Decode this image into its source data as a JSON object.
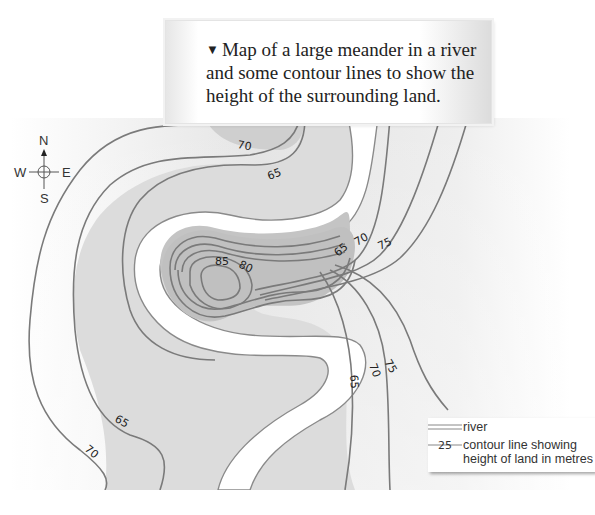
{
  "caption": {
    "bullet": "▼",
    "text": "Map of a large meander in a river and some contour lines to show the height of the surrounding land."
  },
  "compass": {
    "north": "N",
    "south": "S",
    "east": "E",
    "west": "W"
  },
  "contour_labels": [
    {
      "value": "70",
      "position": "top-center"
    },
    {
      "value": "65",
      "position": "top-center-lower"
    },
    {
      "value": "65",
      "position": "right-upper"
    },
    {
      "value": "70",
      "position": "right-upper"
    },
    {
      "value": "75",
      "position": "right-upper"
    },
    {
      "value": "80",
      "position": "center-hill"
    },
    {
      "value": "85",
      "position": "center-hill-summit"
    },
    {
      "value": "75",
      "position": "right-lower"
    },
    {
      "value": "70",
      "position": "right-lower"
    },
    {
      "value": "65",
      "position": "right-lower"
    },
    {
      "value": "65",
      "position": "bottom-left"
    },
    {
      "value": "70",
      "position": "bottom-left"
    }
  ],
  "legend": {
    "river_label": "river",
    "contour_sample": "25",
    "contour_label_line1": "contour line showing",
    "contour_label_line2": "height of land in metres"
  },
  "colors": {
    "river": "#ffffff",
    "contour": "#7a7a7a",
    "land_light": "#f4f4f4",
    "land_mid": "#d9d9d9",
    "hill": "#c2c2c2"
  }
}
